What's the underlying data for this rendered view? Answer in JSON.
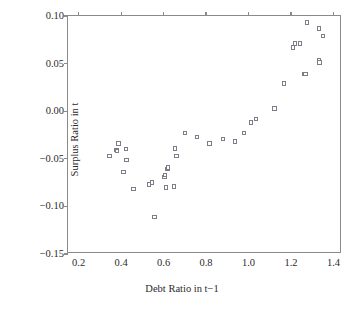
{
  "chart_data": {
    "type": "scatter",
    "title": "",
    "xlabel": "Debt Ratio in t−1",
    "ylabel": "Surplus Ratio in t",
    "xlim": [
      0.15,
      1.44
    ],
    "ylim": [
      -0.15,
      0.1
    ],
    "xticks": [
      0.2,
      0.4,
      0.6,
      0.8,
      1.0,
      1.2,
      1.4
    ],
    "xticklabels": [
      "0.2",
      "0.4",
      "0.6",
      "0.8",
      "1.0",
      "1.2",
      "1.4"
    ],
    "yticks": [
      0.1,
      0.05,
      0.0,
      -0.05,
      -0.1,
      -0.15
    ],
    "yticklabels": [
      "0.10",
      "0.05",
      "0.00",
      "−0.05",
      "−0.10",
      "−0.15"
    ],
    "grid": false,
    "legend": "none",
    "marker": "open-square",
    "marker_color": "#7d7d8a",
    "points": [
      {
        "x": 0.345,
        "y": -0.047
      },
      {
        "x": 0.379,
        "y": -0.041
      },
      {
        "x": 0.38,
        "y": -0.042
      },
      {
        "x": 0.388,
        "y": -0.034
      },
      {
        "x": 0.412,
        "y": -0.064
      },
      {
        "x": 0.422,
        "y": -0.04
      },
      {
        "x": 0.425,
        "y": -0.051
      },
      {
        "x": 0.459,
        "y": -0.082
      },
      {
        "x": 0.531,
        "y": -0.077
      },
      {
        "x": 0.545,
        "y": -0.075
      },
      {
        "x": 0.557,
        "y": -0.111
      },
      {
        "x": 0.604,
        "y": -0.069
      },
      {
        "x": 0.607,
        "y": -0.067
      },
      {
        "x": 0.612,
        "y": -0.08
      },
      {
        "x": 0.618,
        "y": -0.061
      },
      {
        "x": 0.622,
        "y": -0.059
      },
      {
        "x": 0.65,
        "y": -0.079
      },
      {
        "x": 0.655,
        "y": -0.039
      },
      {
        "x": 0.661,
        "y": -0.047
      },
      {
        "x": 0.702,
        "y": -0.023
      },
      {
        "x": 0.757,
        "y": -0.027
      },
      {
        "x": 0.817,
        "y": -0.034
      },
      {
        "x": 0.879,
        "y": -0.029
      },
      {
        "x": 0.935,
        "y": -0.032
      },
      {
        "x": 0.979,
        "y": -0.023
      },
      {
        "x": 1.013,
        "y": -0.012
      },
      {
        "x": 1.035,
        "y": -0.008
      },
      {
        "x": 1.122,
        "y": 0.003
      },
      {
        "x": 1.167,
        "y": 0.029
      },
      {
        "x": 1.208,
        "y": 0.067
      },
      {
        "x": 1.218,
        "y": 0.071
      },
      {
        "x": 1.243,
        "y": 0.071
      },
      {
        "x": 1.262,
        "y": 0.039
      },
      {
        "x": 1.268,
        "y": 0.039
      },
      {
        "x": 1.274,
        "y": 0.093
      },
      {
        "x": 1.331,
        "y": 0.087
      },
      {
        "x": 1.333,
        "y": 0.054
      },
      {
        "x": 1.335,
        "y": 0.051
      },
      {
        "x": 1.352,
        "y": 0.079
      }
    ]
  }
}
